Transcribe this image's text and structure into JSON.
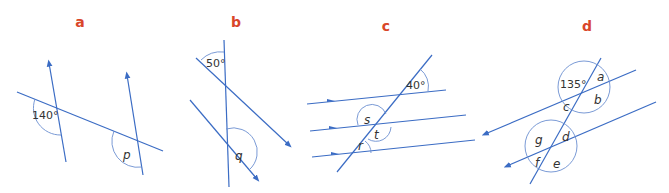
{
  "colors": {
    "line": "#3b6cc4",
    "arc": "#6b8fd0",
    "label": "#d9462a",
    "text": "#333333"
  },
  "panels": [
    {
      "id": "a",
      "label": "a",
      "given_angle": "140°",
      "unknowns": [
        "p"
      ]
    },
    {
      "id": "b",
      "label": "b",
      "given_angle": "50°",
      "unknowns": [
        "q"
      ]
    },
    {
      "id": "c",
      "label": "c",
      "given_angle": "40°",
      "unknowns": [
        "s",
        "t",
        "r"
      ]
    },
    {
      "id": "d",
      "label": "d",
      "given_angle": "135°",
      "unknowns": [
        "a",
        "b",
        "c",
        "d",
        "g",
        "f",
        "e"
      ]
    }
  ]
}
